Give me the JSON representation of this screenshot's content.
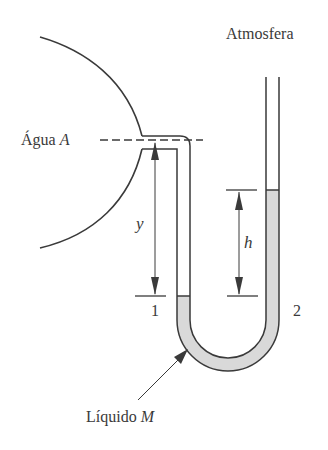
{
  "labels": {
    "atmosphere": "Atmosfera",
    "water_prefix": "Água ",
    "water_var": "A",
    "liquid_prefix": "Líquido ",
    "liquid_var": "M",
    "y": "y",
    "h": "h",
    "point1": "1",
    "point2": "2"
  },
  "colors": {
    "stroke": "#3a3a3a",
    "fluid_fill": "#d9d9d9",
    "background": "#ffffff"
  }
}
